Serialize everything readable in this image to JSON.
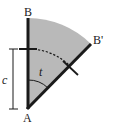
{
  "diagram": {
    "type": "geometry-sector",
    "labels": {
      "top_point": "B",
      "rotated_point": "B'",
      "apex_point": "A",
      "length_label": "c",
      "angle_label": "t"
    },
    "colors": {
      "sector_fill": "#b9b9b9",
      "stroke": "#1a1a1a",
      "background": "#ffffff"
    },
    "elements": [
      "segment AB (vertical, thick)",
      "segment AB' (rotated by angle t, thick)",
      "shaded circular sector between AB and AB'",
      "dashed arc at distance c from A",
      "tick marks at distance c on AB and AB'",
      "dimension bracket labeled c",
      "angle arc labeled t at A"
    ]
  }
}
